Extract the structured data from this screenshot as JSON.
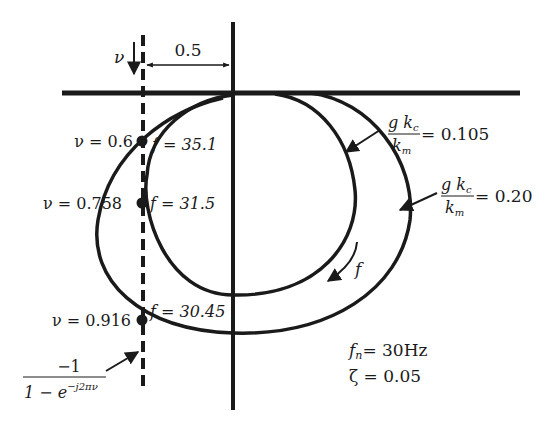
{
  "diagram": {
    "type": "nyquist-stability-diagram",
    "colors": {
      "ink": "#1a1a1a",
      "background": "#ffffff"
    },
    "axes": {
      "real_axis": "horizontal",
      "imag_axis": "vertical",
      "offset_label": "0.5"
    },
    "boundary_line": {
      "style": "dashed",
      "label_numerator": "−1",
      "label_denominator_base": "1 − e",
      "label_denominator_exp": "−j2πν",
      "nu_arrow_label": "ν"
    },
    "curves": [
      {
        "name": "inner",
        "gain_label_num": "g k",
        "gain_label_sub": "c",
        "gain_label_den": "k",
        "gain_label_den_sub": "m",
        "gain_value": "= 0.105"
      },
      {
        "name": "outer",
        "gain_label_num": "g k",
        "gain_label_sub": "c",
        "gain_label_den": "k",
        "gain_label_den_sub": "m",
        "gain_value": "= 0.20"
      }
    ],
    "intersections": [
      {
        "nu_label": "ν = 0.6",
        "f_label": "f = 35.1"
      },
      {
        "nu_label": "ν = 0.758",
        "f_label": "f = 31.5"
      },
      {
        "nu_label": "ν = 0.916",
        "f_label": "f = 30.45"
      }
    ],
    "direction_label": "f",
    "params": {
      "fn_symbol": "f",
      "fn_sub": "n",
      "fn_value": "= 30Hz",
      "zeta": "ζ = 0.05"
    }
  }
}
